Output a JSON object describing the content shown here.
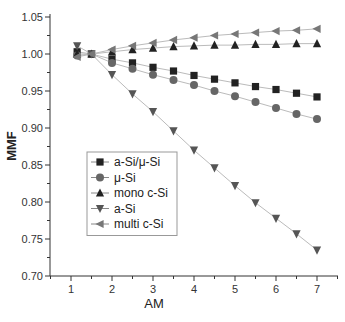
{
  "chart_data": {
    "type": "line",
    "title": "",
    "xlabel": "AM",
    "ylabel": "MMF",
    "xlim": [
      0.5,
      7.5
    ],
    "ylim": [
      0.7,
      1.05
    ],
    "xticks": [
      "1",
      "2",
      "3",
      "4",
      "5",
      "6",
      "7"
    ],
    "yticks": [
      "0.70",
      "0.75",
      "0.80",
      "0.85",
      "0.90",
      "0.95",
      "1.00",
      "1.05"
    ],
    "grid": false,
    "legend_position": "lower-left inside",
    "x": [
      1.15,
      1.5,
      2,
      2.5,
      3,
      3.5,
      4,
      4.5,
      5,
      5.5,
      6,
      6.5,
      7
    ],
    "series": [
      {
        "name": "a-Si/μ-Si",
        "marker": "square",
        "color": "#222222",
        "values": [
          1.003,
          1.0,
          0.993,
          0.988,
          0.982,
          0.977,
          0.971,
          0.966,
          0.961,
          0.956,
          0.952,
          0.947,
          0.942
        ]
      },
      {
        "name": "μ-Si",
        "marker": "circle",
        "color": "#666666",
        "values": [
          0.998,
          1.0,
          0.988,
          0.98,
          0.972,
          0.965,
          0.958,
          0.95,
          0.943,
          0.935,
          0.927,
          0.919,
          0.912
        ]
      },
      {
        "name": "mono c-Si",
        "marker": "triangle-up",
        "color": "#222222",
        "values": [
          1.0,
          1.0,
          1.003,
          1.006,
          1.008,
          1.01,
          1.011,
          1.012,
          1.012,
          1.013,
          1.013,
          1.014,
          1.014
        ]
      },
      {
        "name": "a-Si",
        "marker": "triangle-down",
        "color": "#555555",
        "values": [
          1.011,
          1.0,
          0.972,
          0.946,
          0.922,
          0.896,
          0.87,
          0.846,
          0.822,
          0.799,
          0.778,
          0.757,
          0.735
        ]
      },
      {
        "name": "multi c-Si",
        "marker": "triangle-left",
        "color": "#777777",
        "values": [
          0.996,
          1.0,
          1.006,
          1.011,
          1.015,
          1.019,
          1.022,
          1.025,
          1.027,
          1.029,
          1.031,
          1.032,
          1.034
        ]
      }
    ]
  }
}
